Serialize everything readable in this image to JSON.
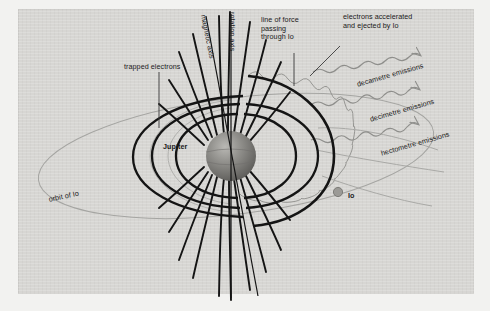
{
  "diagram": {
    "background_color": "#d7d6d3",
    "outer_color": "#f2f2f0",
    "ink_color": "#141414",
    "faint_ink_color": "#9a9a97"
  },
  "bodies": {
    "jupiter": {
      "label": "Jupiter"
    },
    "io": {
      "label": "Io"
    }
  },
  "axes": [
    {
      "name": "magnetic-axis",
      "label": "magnetic axis"
    },
    {
      "name": "rotation-axis",
      "label": "rotation axis"
    }
  ],
  "annotations": {
    "trapped_electrons": "trapped electrons",
    "line_of_force": "line of force\npassing\nthrough Io",
    "line_of_force_lines": [
      "line of force",
      "passing",
      "through Io"
    ],
    "electrons_accelerated": "electrons accelerated\nand ejected by Io",
    "electrons_accelerated_lines": [
      "electrons accelerated",
      "and ejected by Io"
    ],
    "orbit_of_io": "orbit of Io"
  },
  "emissions": [
    {
      "name": "decametre",
      "label": "decametre emissions"
    },
    {
      "name": "decimetre",
      "label": "decimetre emissions"
    },
    {
      "name": "hectometre",
      "label": "hectometre emissions"
    }
  ]
}
